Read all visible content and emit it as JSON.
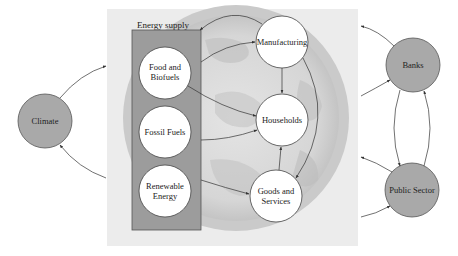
{
  "diagram": {
    "colors": {
      "background": "#ffffff",
      "panel": "#ececec",
      "globe_outer": "#c9c9c9",
      "globe_inner": "#dcdcdc",
      "globe_texture": "#bdbdbd",
      "energy_box_fill": "#9c9c9c",
      "energy_box_stroke": "#555555",
      "inner_node_fill": "#ffffff",
      "outer_node_fill": "#a9a9a9",
      "stroke": "#444444",
      "arrow": "#333333"
    },
    "energy_supply": {
      "label": "Energy supply",
      "nodes": [
        {
          "id": "food",
          "lines": [
            "Food and",
            "Biofuels"
          ]
        },
        {
          "id": "fossil",
          "lines": [
            "Fossil Fuels"
          ]
        },
        {
          "id": "renewable",
          "lines": [
            "Renewable",
            "Energy"
          ]
        }
      ]
    },
    "economy_nodes": [
      {
        "id": "manufacturing",
        "lines": [
          "Manufacturing"
        ]
      },
      {
        "id": "households",
        "lines": [
          "Households"
        ]
      },
      {
        "id": "goods",
        "lines": [
          "Goods and",
          "Services"
        ]
      }
    ],
    "external_nodes": [
      {
        "id": "climate",
        "label": "Climate"
      },
      {
        "id": "banks",
        "label": "Banks"
      },
      {
        "id": "public_sector",
        "label": "Public Sector"
      }
    ],
    "edges": [
      {
        "from": "food",
        "to": "manufacturing"
      },
      {
        "from": "food",
        "to": "households"
      },
      {
        "from": "fossil",
        "to": "households"
      },
      {
        "from": "renewable",
        "to": "goods"
      },
      {
        "from": "manufacturing",
        "to": "energy_supply"
      },
      {
        "from": "manufacturing",
        "to": "households"
      },
      {
        "from": "manufacturing",
        "to": "goods"
      },
      {
        "from": "goods",
        "to": "households"
      },
      {
        "from": "climate",
        "to": "economy"
      },
      {
        "from": "economy",
        "to": "climate"
      },
      {
        "from": "banks",
        "to": "economy"
      },
      {
        "from": "economy",
        "to": "banks"
      },
      {
        "from": "public_sector",
        "to": "economy"
      },
      {
        "from": "economy",
        "to": "public_sector"
      },
      {
        "from": "banks",
        "to": "public_sector"
      },
      {
        "from": "public_sector",
        "to": "banks"
      }
    ]
  }
}
